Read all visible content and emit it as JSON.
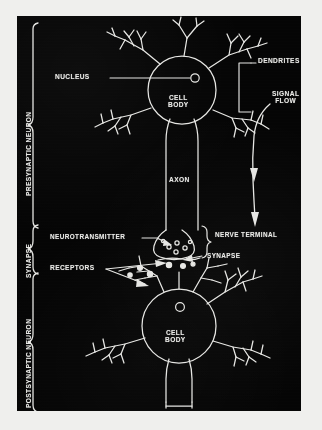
{
  "figure": {
    "kind": "scanned-biology-diagram",
    "panel_background": "#050505",
    "ink_color": "#e9e9e6",
    "page_background": "#efefed"
  },
  "side_labels": [
    {
      "id": "presynaptic",
      "text": "PRESYNAPTIC NEURON",
      "orientation": "vertical",
      "brace": true
    },
    {
      "id": "synapse",
      "text": "SYNAPSE",
      "orientation": "vertical",
      "brace": true
    },
    {
      "id": "postsynaptic",
      "text": "POSTSYNAPTIC NEURON",
      "orientation": "vertical",
      "brace": true
    }
  ],
  "callouts": [
    {
      "id": "nucleus",
      "text": "NUCLEUS",
      "leader": "line-right-to-nucleus-circle"
    },
    {
      "id": "dendrites",
      "text": "DENDRITES",
      "leader": "bracket-to-two-dendrite-clusters"
    },
    {
      "id": "signal-flow",
      "text": "SIGNAL\nFLOW",
      "leader": "curved-arrow-downward"
    },
    {
      "id": "cell-body-upper",
      "text": "CELL\nBODY",
      "leader": "none"
    },
    {
      "id": "axon",
      "text": "AXON",
      "leader": "none"
    },
    {
      "id": "neurotransmitter",
      "text": "NEUROTRANSMITTER",
      "leader": "arrow-right-to-vesicles"
    },
    {
      "id": "nerve-terminal",
      "text": "NERVE TERMINAL",
      "leader": "brace-left"
    },
    {
      "id": "synapse-gap",
      "text": "SYNAPSE",
      "leader": "arrow-left-to-cleft"
    },
    {
      "id": "receptors",
      "text": "RECEPTORS",
      "leader": "two-arrows-fanning-right"
    },
    {
      "id": "cell-body-lower",
      "text": "CELL\nBODY",
      "leader": "none"
    }
  ],
  "structures": {
    "presynaptic_soma": "circle with nucleus, five dendrite trees, axon descending",
    "axon": "long vertical fiber from upper soma to nerve terminal",
    "nerve_terminal": "bulb containing neurotransmitter vesicles",
    "synaptic_cleft": "narrow gap between terminal and postsynaptic dendrites",
    "postsynaptic_soma": "circle with nucleus, dendrite trees bearing receptors, axon descending off-figure"
  }
}
